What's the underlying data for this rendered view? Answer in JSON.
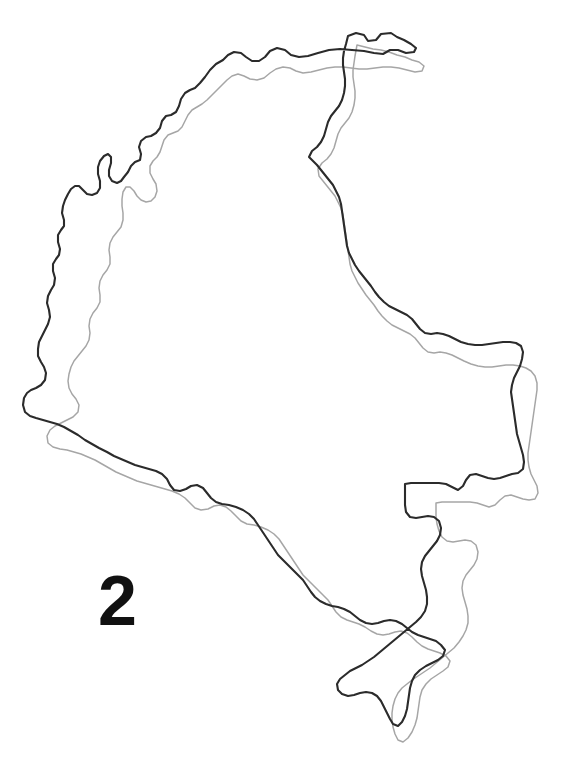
{
  "figure": {
    "label": "2",
    "caption_number": "2",
    "background_color": "#ffffff",
    "width_px": 581,
    "height_px": 776
  },
  "map": {
    "subject": "colombia-outline",
    "view_box": "0 0 581 776",
    "layers": [
      {
        "name": "reference-outline",
        "role": "dark-reference-boundary",
        "color": "#2b2b2b",
        "stroke_width": 2.1,
        "path": "M 348 36 L 356 33 L 364 35 L 368 41 L 376 40 L 381 34 L 391 33 L 397 37 L 404 40 L 411 44 L 416 48 L 414 52 L 406 53 L 398 50 L 390 50 L 383 54 L 374 53 L 364 51 L 352 50 L 340 49 L 329 50 L 318 53 L 308 56 L 299 57 L 291 55 L 285 50 L 277 48 L 270 51 L 265 57 L 259 61 L 252 61 L 246 57 L 241 53 L 234 52 L 228 55 L 223 60 L 216 64 L 210 70 L 205 77 L 200 83 L 195 88 L 190 90 L 185 93 L 181 99 L 179 106 L 176 112 L 171 115 L 166 116 L 162 121 L 160 128 L 156 133 L 151 136 L 146 137 L 141 141 L 139 147 L 141 154 L 140 160 L 135 162 L 131 166 L 128 172 L 124 177 L 121 181 L 117 183 L 112 181 L 109 176 L 109 170 L 111 163 L 111 157 L 108 154 L 104 156 L 100 161 L 98 167 L 98 174 L 100 181 L 100 188 L 97 193 L 92 195 L 87 194 L 83 190 L 79 186 L 75 186 L 71 189 L 68 194 L 65 200 L 63 206 L 62 213 L 64 220 L 64 226 L 61 230 L 58 235 L 58 242 L 60 249 L 59 255 L 56 259 L 53 264 L 53 271 L 55 278 L 54 285 L 51 290 L 48 296 L 47 303 L 49 310 L 50 317 L 48 324 L 45 330 L 42 336 L 39 342 L 38 349 L 38 356 L 41 362 L 44 367 L 46 373 L 45 380 L 41 385 L 36 388 L 31 390 L 27 393 L 24 398 L 23 405 L 25 412 L 30 416 L 36 418 L 43 420 L 50 422 L 57 424 L 64 427 L 71 431 L 78 435 L 85 440 L 92 444 L 99 448 L 107 452 L 114 456 L 121 459 L 128 462 L 135 465 L 142 467 L 149 469 L 156 471 L 162 474 L 167 479 L 170 485 L 174 490 L 180 491 L 186 489 L 191 486 L 197 485 L 203 488 L 207 493 L 211 498 L 216 502 L 222 504 L 229 505 L 236 507 L 243 510 L 249 514 L 254 519 L 258 525 L 262 531 L 266 537 L 270 543 L 274 549 L 278 555 L 283 560 L 288 565 L 293 570 L 298 575 L 303 580 L 307 586 L 311 592 L 315 597 L 320 601 L 326 604 L 332 606 L 338 607 L 344 609 L 350 612 L 355 616 L 360 620 L 366 623 L 372 624 L 378 623 L 384 621 L 390 620 L 396 621 L 402 624 L 407 628 L 412 632 L 418 635 L 424 637 L 430 639 L 436 641 L 441 645 L 445 650 L 443 656 L 438 660 L 432 663 L 426 666 L 420 670 L 415 675 L 412 681 L 410 688 L 409 695 L 408 702 L 407 709 L 405 716 L 402 722 L 398 726 L 393 724 L 390 719 L 387 713 L 384 707 L 381 701 L 377 696 L 372 693 L 366 692 L 360 693 L 354 695 L 348 696 L 342 694 L 338 690 L 337 684 L 340 679 L 345 675 L 350 671 L 356 668 L 362 665 L 368 661 L 374 657 L 380 652 L 386 647 L 392 642 L 398 637 L 404 632 L 410 627 L 416 622 L 421 617 L 425 611 L 427 604 L 427 597 L 426 590 L 424 583 L 422 576 L 421 569 L 422 562 L 425 556 L 429 551 L 433 546 L 437 541 L 440 535 L 441 528 L 439 521 L 434 517 L 428 516 L 422 517 L 416 518 L 410 517 L 406 512 L 405 505 L 405 498 L 405 491 L 405 484 L 411 483 L 418 483 L 425 483 L 432 483 L 439 483 L 446 484 L 452 487 L 458 490 L 463 486 L 466 480 L 470 475 L 476 474 L 482 476 L 488 478 L 494 479 L 500 478 L 506 476 L 512 474 L 518 473 L 523 469 L 524 462 L 523 455 L 521 448 L 519 441 L 517 434 L 516 427 L 515 420 L 514 413 L 513 406 L 512 399 L 511 392 L 512 385 L 514 378 L 517 372 L 520 366 L 522 359 L 523 352 L 521 346 L 516 343 L 510 342 L 503 342 L 496 343 L 489 344 L 482 345 L 475 345 L 468 344 L 461 342 L 455 339 L 449 336 L 443 334 L 437 333 L 431 334 L 425 333 L 420 329 L 416 324 L 412 319 L 407 315 L 401 312 L 395 309 L 389 306 L 384 302 L 379 297 L 375 292 L 371 286 L 367 281 L 363 276 L 359 271 L 355 265 L 352 259 L 349 253 L 347 246 L 346 239 L 345 232 L 344 225 L 343 218 L 342 211 L 341 204 L 339 197 L 336 191 L 333 185 L 329 180 L 325 175 L 321 170 L 317 165 L 313 161 L 309 157 L 312 151 L 317 147 L 321 142 L 324 136 L 326 129 L 328 122 L 331 116 L 335 111 L 339 106 L 342 100 L 344 93 L 345 86 L 345 79 L 344 72 L 343 65 L 343 58 L 344 51 L 346 44 Z"
      },
      {
        "name": "traced-outline",
        "role": "light-gray-offset-trace",
        "color": "#a6a6a6",
        "stroke_width": 1.5,
        "path": "M 357 45 L 365 47 L 373 49 L 381 50 L 389 52 L 397 55 L 405 57 L 412 60 L 419 62 L 424 66 L 422 71 L 415 72 L 407 70 L 399 68 L 391 67 L 383 67 L 375 68 L 367 69 L 359 69 L 351 68 L 343 67 L 335 67 L 327 68 L 319 70 L 311 72 L 303 73 L 296 71 L 290 68 L 283 67 L 276 69 L 270 73 L 264 78 L 257 80 L 250 79 L 244 76 L 238 74 L 232 76 L 227 80 L 222 85 L 217 90 L 212 95 L 207 100 L 202 104 L 197 107 L 192 110 L 188 115 L 185 121 L 182 127 L 178 131 L 173 133 L 168 135 L 164 140 L 162 146 L 160 152 L 157 157 L 153 161 L 150 166 L 150 173 L 153 179 L 156 184 L 157 191 L 155 197 L 151 201 L 146 202 L 141 200 L 137 196 L 134 191 L 130 187 L 126 187 L 123 192 L 122 199 L 122 206 L 123 213 L 123 220 L 121 227 L 117 232 L 113 237 L 110 243 L 109 250 L 110 257 L 110 264 L 107 270 L 103 275 L 100 281 L 99 288 L 100 295 L 100 302 L 97 308 L 93 313 L 90 319 L 89 326 L 90 333 L 89 340 L 86 346 L 82 351 L 78 356 L 74 361 L 71 367 L 69 374 L 68 381 L 69 388 L 72 394 L 76 399 L 79 405 L 78 412 L 73 417 L 67 420 L 61 423 L 55 426 L 50 430 L 47 436 L 48 443 L 53 447 L 60 449 L 67 450 L 74 452 L 81 454 L 88 457 L 95 460 L 102 464 L 109 468 L 116 472 L 123 475 L 130 478 L 137 481 L 144 483 L 151 485 L 158 487 L 165 489 L 172 491 L 179 494 L 185 498 L 190 503 L 195 508 L 201 510 L 208 509 L 214 506 L 220 505 L 226 507 L 231 511 L 236 516 L 241 521 L 247 524 L 254 525 L 261 527 L 268 530 L 274 534 L 279 539 L 283 545 L 287 551 L 291 557 L 295 563 L 299 569 L 303 575 L 308 580 L 313 585 L 318 590 L 323 595 L 328 600 L 332 606 L 336 612 L 341 617 L 347 620 L 353 622 L 359 624 L 365 627 L 371 631 L 377 634 L 383 635 L 389 634 L 395 632 L 401 631 L 407 633 L 412 637 L 417 642 L 422 646 L 428 649 L 434 651 L 440 653 L 446 656 L 450 661 L 448 667 L 443 671 L 437 675 L 431 679 L 426 684 L 422 690 L 420 697 L 419 704 L 418 711 L 417 718 L 415 725 L 412 732 L 408 738 L 403 742 L 398 740 L 395 734 L 393 727 L 392 720 L 392 713 L 393 706 L 395 699 L 398 693 L 402 688 L 407 684 L 412 680 L 418 676 L 424 672 L 430 668 L 436 663 L 442 658 L 448 653 L 454 648 L 459 642 L 463 636 L 466 630 L 468 623 L 468 616 L 467 609 L 465 602 L 463 595 L 462 588 L 463 581 L 466 575 L 470 570 L 474 565 L 477 559 L 478 552 L 476 545 L 471 541 L 465 540 L 459 541 L 453 542 L 447 541 L 442 537 L 439 531 L 437 524 L 436 517 L 436 510 L 436 503 L 442 502 L 449 502 L 456 502 L 463 502 L 470 502 L 477 503 L 483 505 L 489 507 L 495 505 L 500 500 L 505 496 L 511 495 L 517 497 L 523 499 L 529 500 L 535 499 L 538 493 L 537 486 L 534 480 L 531 474 L 529 467 L 528 460 L 528 453 L 529 446 L 530 439 L 531 432 L 532 425 L 533 418 L 534 411 L 535 404 L 536 397 L 537 390 L 537 383 L 535 376 L 531 371 L 526 368 L 520 366 L 513 365 L 506 365 L 499 366 L 492 367 L 485 367 L 478 366 L 471 364 L 464 361 L 458 358 L 452 355 L 446 353 L 440 352 L 434 353 L 428 352 L 423 348 L 419 343 L 415 338 L 410 334 L 404 331 L 398 328 L 392 325 L 387 321 L 382 316 L 378 311 L 374 305 L 370 300 L 366 295 L 362 289 L 358 283 L 355 277 L 352 271 L 350 264 L 349 257 L 348 250 L 347 243 L 346 236 L 345 229 L 344 222 L 343 215 L 341 208 L 338 202 L 335 196 L 331 191 L 327 186 L 323 181 L 319 176 L 318 169 L 322 163 L 327 159 L 331 154 L 334 148 L 336 141 L 338 134 L 341 128 L 345 123 L 349 118 L 352 112 L 354 105 L 355 98 L 355 91 L 354 84 L 353 77 L 353 70 L 354 63 L 355 56 Z"
      }
    ]
  }
}
